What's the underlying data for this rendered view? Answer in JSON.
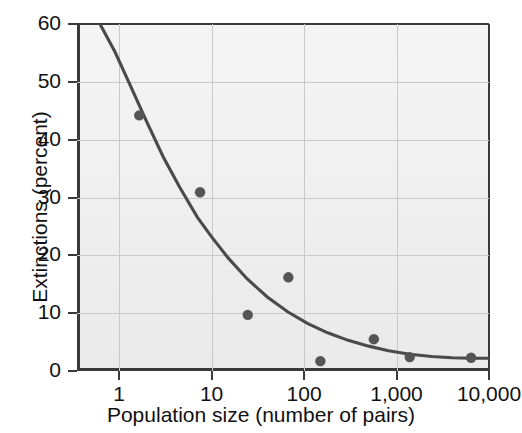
{
  "chart_data": {
    "type": "scatter",
    "title": "",
    "xlabel": "Population size (number of pairs)",
    "ylabel": "Extinctions (percent)",
    "xscale": "log",
    "yscale": "linear",
    "xlim": [
      0.35,
      10000
    ],
    "ylim": [
      0,
      60
    ],
    "xticks": [
      1,
      10,
      100,
      1000,
      10000
    ],
    "xtick_labels": [
      "1",
      "10",
      "100",
      "1,000",
      "10,000"
    ],
    "yticks": [
      0,
      10,
      20,
      30,
      40,
      50,
      60
    ],
    "ytick_labels": [
      "0",
      "10",
      "20",
      "30",
      "40",
      "50",
      "60"
    ],
    "grid": true,
    "grid_axes": "both",
    "legend": "none",
    "points": [
      {
        "x": 1.65,
        "y": 44.2
      },
      {
        "x": 7.5,
        "y": 30.9
      },
      {
        "x": 24.6,
        "y": 9.7
      },
      {
        "x": 67.6,
        "y": 16.2
      },
      {
        "x": 150,
        "y": 1.7
      },
      {
        "x": 568,
        "y": 5.5
      },
      {
        "x": 1390,
        "y": 2.4
      },
      {
        "x": 6400,
        "y": 2.3
      }
    ],
    "fit_curve": {
      "name": "fitted decay curve",
      "x": [
        0.62,
        0.9,
        1.3,
        2.0,
        3.0,
        4.5,
        7.0,
        10,
        15,
        24,
        40,
        67,
        110,
        180,
        300,
        500,
        820,
        1390,
        2400,
        4000,
        6400,
        10000
      ],
      "y": [
        60.0,
        55.2,
        49.6,
        43.0,
        37.0,
        31.8,
        26.6,
        23.2,
        19.6,
        16.0,
        12.8,
        10.2,
        8.2,
        6.6,
        5.3,
        4.3,
        3.5,
        2.9,
        2.5,
        2.3,
        2.2,
        2.2
      ]
    },
    "colors": {
      "point": "#555555",
      "curve": "#4a4a4a",
      "axis": "#3a3a3a",
      "grid": "#c9c9c9",
      "plot_background": "#f1f1f1",
      "page_background": "#ffffff"
    }
  }
}
